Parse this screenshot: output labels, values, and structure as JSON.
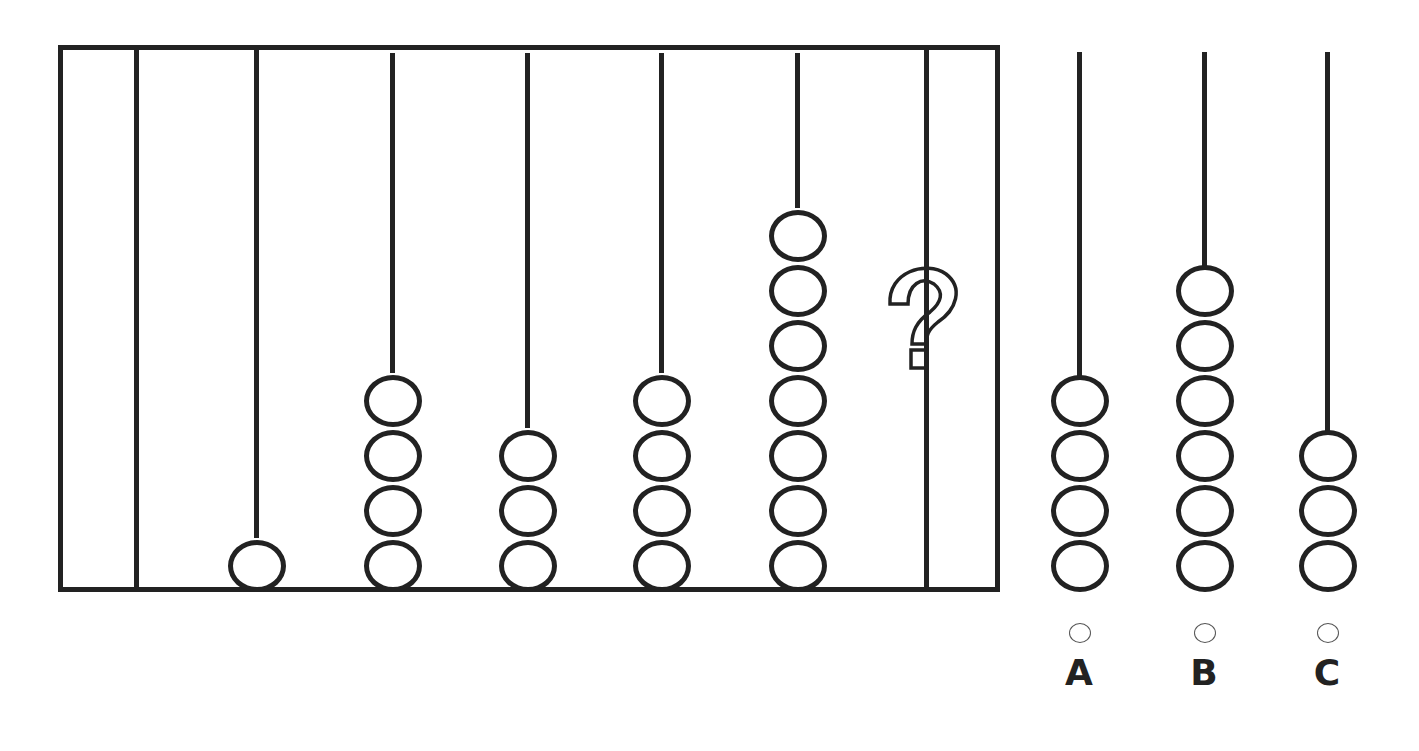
{
  "puzzle": {
    "type": "abacus-sequence",
    "question_mark": "?",
    "frame_rods": [
      {
        "index": 1,
        "beads": 0
      },
      {
        "index": 2,
        "beads": 1
      },
      {
        "index": 3,
        "beads": 4
      },
      {
        "index": 4,
        "beads": 3
      },
      {
        "index": 5,
        "beads": 4
      },
      {
        "index": 6,
        "beads": 7
      },
      {
        "index": 7,
        "beads": "?"
      }
    ],
    "options": [
      {
        "label": "A",
        "beads": 4
      },
      {
        "label": "B",
        "beads": 6
      },
      {
        "label": "C",
        "beads": 3
      }
    ]
  },
  "colors": {
    "stroke": "#222222",
    "background": "#ffffff",
    "radio_border": "#555555"
  }
}
